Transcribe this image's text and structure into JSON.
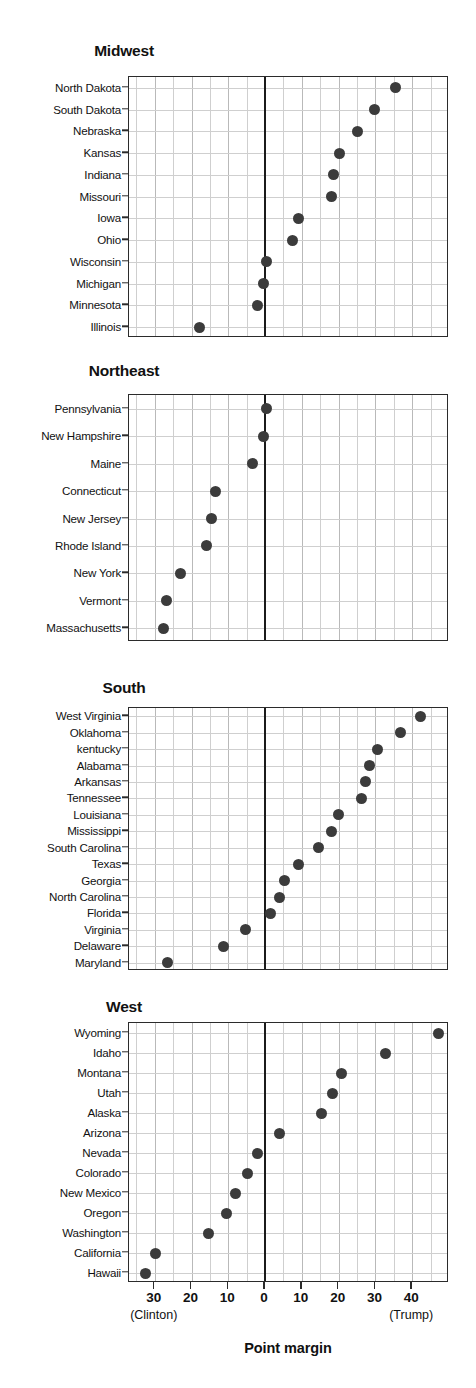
{
  "chart_data": {
    "type": "scatter",
    "title": "",
    "xlabel": "Point margin",
    "ylabel": "",
    "xlim": [
      -37,
      50
    ],
    "xticks": [
      -30,
      -20,
      -10,
      0,
      10,
      20,
      30,
      40
    ],
    "xticklabels": [
      "30",
      "20",
      "10",
      "0",
      "10",
      "20",
      "30",
      "40"
    ],
    "grid": true,
    "legend": "none",
    "axis_endcap_left": "(Clinton)",
    "axis_endcap_right": "(Trump)",
    "zero_reference_line": 0,
    "note": "Dot plot of 2016 US presidential election point margin by state, faceted by census region. Negative = Clinton margin, positive = Trump margin.",
    "panels": [
      {
        "title": "Midwest",
        "categories": [
          "North Dakota",
          "South Dakota",
          "Nebraska",
          "Kansas",
          "Indiana",
          "Missouri",
          "Iowa",
          "Ohio",
          "Wisconsin",
          "Michigan",
          "Minnesota",
          "Illinois"
        ],
        "values": [
          35.4,
          29.7,
          25.0,
          20.2,
          18.5,
          18.0,
          9.0,
          7.4,
          0.3,
          -0.3,
          -2.2,
          -17.7
        ]
      },
      {
        "title": "Northeast",
        "categories": [
          "Pennsylvania",
          "New Hampshire",
          "Maine",
          "Connecticut",
          "New Jersey",
          "Rhode Island",
          "New York",
          "Vermont",
          "Massachusetts"
        ],
        "values": [
          0.3,
          -0.5,
          -3.5,
          -13.6,
          -14.5,
          -15.9,
          -22.9,
          -26.8,
          -27.5
        ]
      },
      {
        "title": "South",
        "categories": [
          "West Virginia",
          "Oklahoma",
          "kentucky",
          "Alabama",
          "Arkansas",
          "Tennessee",
          "Louisiana",
          "Mississippi",
          "South Carolina",
          "Texas",
          "Georgia",
          "North Carolina",
          "Florida",
          "Virginia",
          "Delaware",
          "Maryland"
        ],
        "values": [
          42.2,
          36.8,
          30.5,
          28.3,
          27.4,
          26.2,
          19.9,
          18.0,
          14.4,
          9.0,
          5.2,
          3.8,
          1.6,
          -5.2,
          -11.2,
          -26.4
        ]
      },
      {
        "title": "West",
        "categories": [
          "Wyoming",
          "Idaho",
          "Montana",
          "Utah",
          "Alaska",
          "Arizona",
          "Nevada",
          "Colorado",
          "New Mexico",
          "Oregon",
          "Washington",
          "California",
          "Hawaii"
        ],
        "values": [
          47.2,
          32.6,
          20.8,
          18.3,
          15.2,
          3.8,
          -2.2,
          -4.9,
          -8.0,
          -10.6,
          -15.4,
          -29.7,
          -32.4
        ]
      }
    ]
  },
  "colors": {
    "dot": "#3b3b3b",
    "axis": "#2b2b2b",
    "grid": "#cfcfcf",
    "background": "#ffffff",
    "text": "#111111"
  }
}
